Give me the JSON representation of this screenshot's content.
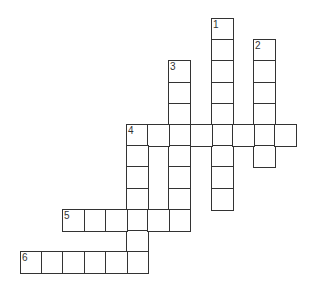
{
  "puzzle": {
    "type": "crossword",
    "cell_size": 21.2,
    "origin": {
      "x": 20,
      "y": 18
    },
    "clues": [
      {
        "number": "1",
        "direction": "down",
        "col": 9,
        "row": 0,
        "length": 9
      },
      {
        "number": "2",
        "direction": "down",
        "col": 11,
        "row": 1,
        "length": 6
      },
      {
        "number": "3",
        "direction": "down",
        "col": 7,
        "row": 2,
        "length": 8
      },
      {
        "number": "4",
        "direction": "across",
        "col": 5,
        "row": 5,
        "length": 8
      },
      {
        "number": "4",
        "direction": "down",
        "col": 5,
        "row": 5,
        "length": 7
      },
      {
        "number": "5",
        "direction": "across",
        "col": 2,
        "row": 9,
        "length": 6
      },
      {
        "number": "6",
        "direction": "across",
        "col": 0,
        "row": 11,
        "length": 6
      }
    ]
  }
}
